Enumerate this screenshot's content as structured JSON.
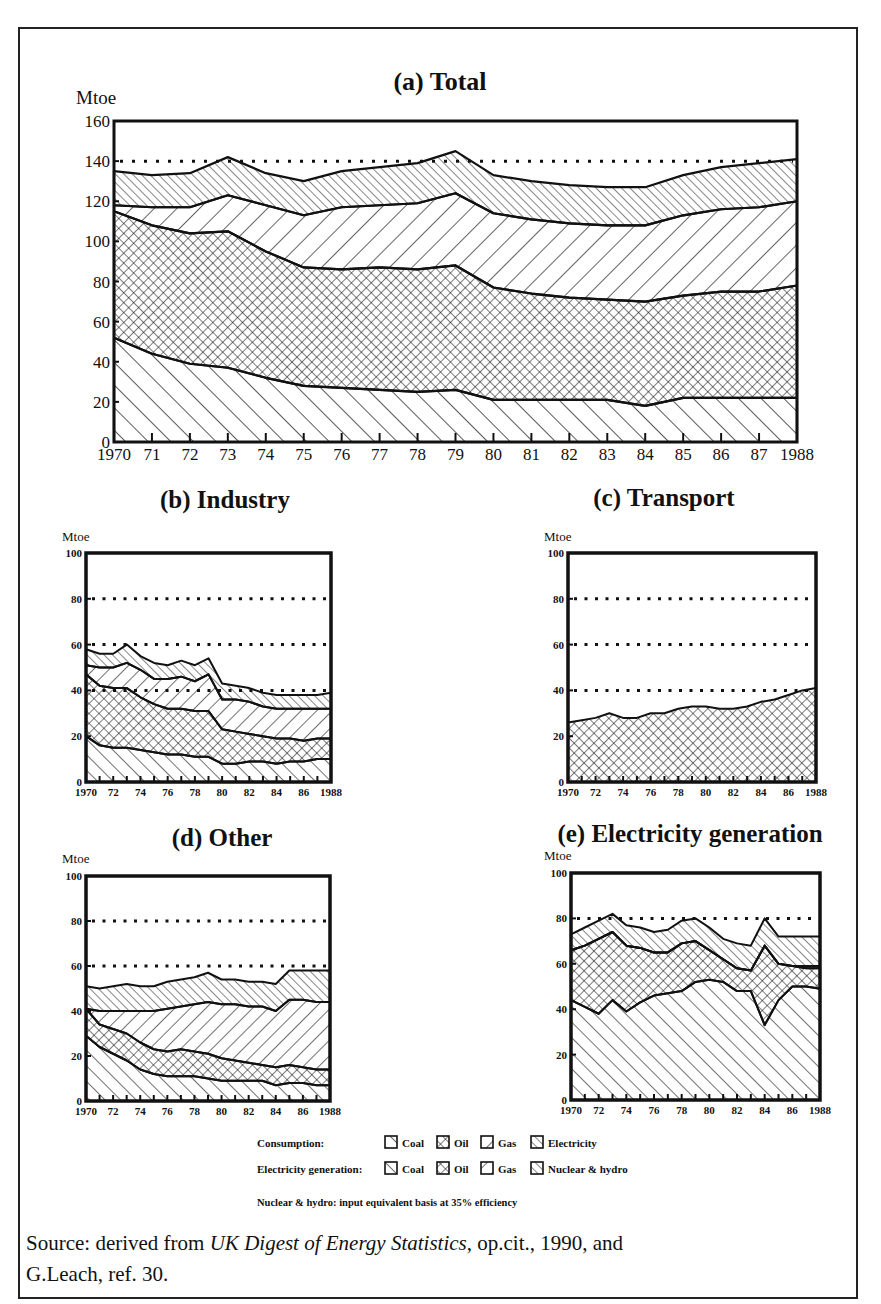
{
  "figure": {
    "source_line1_pre": "Source: derived from ",
    "source_line1_italic": "UK Digest of Energy Statistics",
    "source_line1_post": ", op.cit., 1990, and",
    "source_line2": "G.Leach,  ref. 30."
  },
  "legend": {
    "consumption_label": "Consumption:",
    "generation_label": "Electricity generation:",
    "consumption_items": [
      "Coal",
      "Oil",
      "Gas",
      "Electricity"
    ],
    "generation_items": [
      "Coal",
      "Oil",
      "Gas",
      "Nuclear &  hydro"
    ],
    "note": "Nuclear & hydro: input equivalent basis at 35% efficiency"
  },
  "chart_data": [
    {
      "id": "total",
      "type": "area",
      "stacked": true,
      "title": "(a) Total",
      "ylabel": "Mtoe",
      "ylim": [
        0,
        160
      ],
      "yticks": [
        0,
        20,
        40,
        60,
        80,
        100,
        120,
        140,
        160
      ],
      "dotted_gridlines": [
        140
      ],
      "x": [
        1970,
        1971,
        1972,
        1973,
        1974,
        1975,
        1976,
        1977,
        1978,
        1979,
        1980,
        1981,
        1982,
        1983,
        1984,
        1985,
        1986,
        1987,
        1988
      ],
      "xtick_labels": [
        "1970",
        "71",
        "72",
        "73",
        "74",
        "75",
        "76",
        "77",
        "78",
        "79",
        "80",
        "81",
        "82",
        "83",
        "84",
        "85",
        "86",
        "87",
        "1988"
      ],
      "series": [
        {
          "name": "Coal",
          "values": [
            52,
            44,
            39,
            37,
            32,
            28,
            27,
            26,
            25,
            26,
            21,
            21,
            21,
            21,
            18,
            22,
            22,
            22,
            22
          ]
        },
        {
          "name": "Oil",
          "values": [
            63,
            64,
            65,
            68,
            63,
            59,
            59,
            61,
            61,
            62,
            56,
            53,
            51,
            50,
            52,
            51,
            53,
            53,
            56
          ]
        },
        {
          "name": "Gas",
          "values": [
            3,
            9,
            13,
            18,
            23,
            26,
            31,
            31,
            33,
            36,
            37,
            37,
            37,
            37,
            38,
            40,
            41,
            42,
            42
          ]
        },
        {
          "name": "Electricity",
          "values": [
            17,
            16,
            17,
            19,
            16,
            17,
            18,
            19,
            20,
            21,
            19,
            19,
            19,
            19,
            19,
            20,
            21,
            22,
            21
          ]
        }
      ]
    },
    {
      "id": "industry",
      "type": "area",
      "stacked": true,
      "title": "(b) Industry",
      "ylabel": "Mtoe",
      "ylim": [
        0,
        100
      ],
      "yticks": [
        0,
        20,
        40,
        60,
        80,
        100
      ],
      "dotted_gridlines": [
        40,
        60,
        80
      ],
      "x": [
        1970,
        1971,
        1972,
        1973,
        1974,
        1975,
        1976,
        1977,
        1978,
        1979,
        1980,
        1981,
        1982,
        1983,
        1984,
        1985,
        1986,
        1987,
        1988
      ],
      "xtick_labels": [
        "1970",
        "72",
        "74",
        "76",
        "78",
        "80",
        "82",
        "84",
        "86",
        "1988"
      ],
      "series": [
        {
          "name": "Coal",
          "values": [
            20,
            16,
            15,
            15,
            14,
            13,
            12,
            12,
            11,
            11,
            8,
            8,
            9,
            9,
            8,
            9,
            9,
            10,
            10
          ]
        },
        {
          "name": "Oil",
          "values": [
            27,
            26,
            26,
            26,
            23,
            21,
            20,
            20,
            20,
            20,
            15,
            14,
            12,
            11,
            11,
            10,
            9,
            9,
            9
          ]
        },
        {
          "name": "Gas",
          "values": [
            4,
            8,
            9,
            11,
            12,
            11,
            13,
            14,
            13,
            16,
            13,
            14,
            14,
            13,
            13,
            13,
            14,
            13,
            13
          ]
        },
        {
          "name": "Electricity",
          "values": [
            7,
            6,
            6,
            8,
            6,
            7,
            6,
            7,
            7,
            7,
            7,
            6,
            6,
            6,
            6,
            6,
            6,
            6,
            7
          ]
        }
      ]
    },
    {
      "id": "transport",
      "type": "area",
      "stacked": true,
      "title": "(c) Transport",
      "ylabel": "Mtoe",
      "ylim": [
        0,
        100
      ],
      "yticks": [
        0,
        20,
        40,
        60,
        80,
        100
      ],
      "dotted_gridlines": [
        40,
        60,
        80
      ],
      "x": [
        1970,
        1971,
        1972,
        1973,
        1974,
        1975,
        1976,
        1977,
        1978,
        1979,
        1980,
        1981,
        1982,
        1983,
        1984,
        1985,
        1986,
        1987,
        1988
      ],
      "xtick_labels": [
        "1970",
        "72",
        "74",
        "76",
        "78",
        "80",
        "82",
        "84",
        "86",
        "1988"
      ],
      "series": [
        {
          "name": "Oil",
          "values": [
            26,
            27,
            28,
            30,
            28,
            28,
            30,
            30,
            32,
            33,
            33,
            32,
            32,
            33,
            35,
            36,
            38,
            40,
            41
          ]
        }
      ]
    },
    {
      "id": "other",
      "type": "area",
      "stacked": true,
      "title": "(d) Other",
      "ylabel": "Mtoe",
      "ylim": [
        0,
        100
      ],
      "yticks": [
        0,
        20,
        40,
        60,
        80,
        100
      ],
      "dotted_gridlines": [
        60,
        80
      ],
      "x": [
        1970,
        1971,
        1972,
        1973,
        1974,
        1975,
        1976,
        1977,
        1978,
        1979,
        1980,
        1981,
        1982,
        1983,
        1984,
        1985,
        1986,
        1987,
        1988
      ],
      "xtick_labels": [
        "1970",
        "72",
        "74",
        "76",
        "78",
        "80",
        "82",
        "84",
        "86",
        "1988"
      ],
      "series": [
        {
          "name": "Coal",
          "values": [
            29,
            24,
            21,
            18,
            14,
            12,
            11,
            11,
            11,
            10,
            9,
            9,
            9,
            9,
            7,
            8,
            8,
            7,
            7
          ]
        },
        {
          "name": "Oil",
          "values": [
            12,
            10,
            11,
            12,
            12,
            11,
            11,
            12,
            11,
            11,
            10,
            9,
            8,
            7,
            8,
            8,
            7,
            7,
            7
          ]
        },
        {
          "name": "Gas",
          "values": [
            0,
            6,
            8,
            10,
            14,
            17,
            19,
            19,
            21,
            23,
            24,
            25,
            25,
            26,
            25,
            29,
            30,
            30,
            30
          ]
        },
        {
          "name": "Electricity",
          "values": [
            10,
            10,
            11,
            12,
            11,
            11,
            12,
            12,
            12,
            13,
            11,
            11,
            11,
            11,
            12,
            13,
            13,
            14,
            14
          ]
        }
      ]
    },
    {
      "id": "electricity-generation",
      "type": "area",
      "stacked": true,
      "title": "(e) Electricity generation",
      "ylabel": "Mtoe",
      "ylim": [
        0,
        100
      ],
      "yticks": [
        0,
        20,
        40,
        60,
        80,
        100
      ],
      "dotted_gridlines": [
        80
      ],
      "x": [
        1970,
        1971,
        1972,
        1973,
        1974,
        1975,
        1976,
        1977,
        1978,
        1979,
        1980,
        1981,
        1982,
        1983,
        1984,
        1985,
        1986,
        1987,
        1988
      ],
      "xtick_labels": [
        "1970",
        "72",
        "74",
        "76",
        "78",
        "80",
        "82",
        "84",
        "86",
        "1988"
      ],
      "series": [
        {
          "name": "Coal",
          "values": [
            44,
            41,
            38,
            44,
            39,
            43,
            46,
            47,
            48,
            52,
            53,
            52,
            48,
            48,
            33,
            44,
            50,
            50,
            49
          ]
        },
        {
          "name": "Oil",
          "values": [
            22,
            27,
            33,
            30,
            29,
            24,
            19,
            18,
            21,
            18,
            13,
            10,
            10,
            9,
            35,
            16,
            9,
            8,
            9
          ]
        },
        {
          "name": "Gas",
          "values": [
            0,
            0,
            0,
            0,
            0,
            0,
            0,
            0,
            0,
            0,
            0,
            0,
            0,
            0,
            0,
            0,
            0,
            1,
            1
          ]
        },
        {
          "name": "Nuclear & hydro",
          "values": [
            7,
            8,
            8,
            8,
            9,
            9,
            9,
            10,
            10,
            10,
            10,
            9,
            11,
            11,
            12,
            12,
            13,
            13,
            13
          ]
        }
      ]
    }
  ]
}
